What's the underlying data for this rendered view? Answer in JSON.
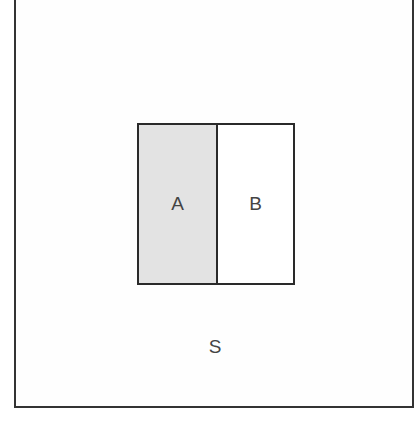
{
  "diagram": {
    "type": "venn-partition",
    "universe": {
      "label": "S"
    },
    "regions": [
      {
        "label": "A",
        "fill": "#e3e3e3"
      },
      {
        "label": "B",
        "fill": "#ffffff"
      }
    ],
    "stroke_color": "#2a2a2a"
  }
}
